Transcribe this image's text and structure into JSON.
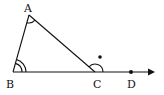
{
  "diagram": {
    "type": "geometry-triangle-exterior-angle",
    "stroke_color": "#111111",
    "background": "#ffffff",
    "points": [
      {
        "id": "A",
        "label": "A",
        "x": 29,
        "y": 15,
        "label_x": 24,
        "label_y": 12
      },
      {
        "id": "B",
        "label": "B",
        "x": 13,
        "y": 72,
        "label_x": 6,
        "label_y": 88
      },
      {
        "id": "C",
        "label": "C",
        "x": 95,
        "y": 72,
        "label_x": 93,
        "label_y": 88
      },
      {
        "id": "D",
        "label": "D",
        "x": 131,
        "y": 72,
        "label_x": 127,
        "label_y": 88
      }
    ],
    "segments": [
      [
        "A",
        "B"
      ],
      [
        "A",
        "C"
      ],
      [
        "B",
        "C"
      ]
    ],
    "ray": {
      "from": "B",
      "through": "D",
      "arrow_tip": [
        155,
        72
      ]
    },
    "angle_marks": [
      {
        "vertex": "A",
        "arcs": 1
      },
      {
        "vertex": "B",
        "arcs": 2
      },
      {
        "vertex": "C",
        "arcs": 1,
        "exterior": true
      }
    ],
    "extra_dot": {
      "x": 100,
      "y": 57
    }
  }
}
